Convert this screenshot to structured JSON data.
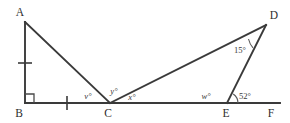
{
  "figure": {
    "type": "geometry-diagram",
    "background_color": "#ffffff",
    "line_color": "#3a3a3a",
    "vertices": [
      {
        "id": "A",
        "label": "A",
        "x": 25,
        "y": 22,
        "label_x": 20,
        "label_y": 16
      },
      {
        "id": "B",
        "label": "B",
        "x": 25,
        "y": 103,
        "label_x": 19,
        "label_y": 117
      },
      {
        "id": "C",
        "label": "C",
        "x": 110,
        "y": 103,
        "label_x": 105,
        "label_y": 117
      },
      {
        "id": "D",
        "label": "D",
        "x": 266,
        "y": 25,
        "label_x": 272,
        "label_y": 19
      },
      {
        "id": "E",
        "label": "E",
        "x": 227,
        "y": 103,
        "label_x": 222,
        "label_y": 117
      },
      {
        "id": "F",
        "label": "F",
        "x": 272,
        "y": 103,
        "label_x": 268,
        "label_y": 117
      }
    ],
    "segments": [
      {
        "name": "segment-AB",
        "from": "A",
        "to": "B"
      },
      {
        "name": "segment-AC",
        "from": "A",
        "to": "C"
      },
      {
        "name": "segment-BF",
        "from": "B",
        "to": "F"
      },
      {
        "name": "segment-CD",
        "from": "C",
        "to": "D"
      },
      {
        "name": "segment-DE",
        "from": "D",
        "to": "E"
      }
    ],
    "tick_marks": [
      {
        "name": "tick-mark-AB",
        "on_segment": "AB",
        "x": 25,
        "y": 63,
        "orientation": "horizontal"
      },
      {
        "name": "tick-mark-BC",
        "on_segment": "BC",
        "x": 67,
        "y": 103,
        "orientation": "vertical"
      }
    ],
    "right_angle": {
      "name": "right-angle-marker-B",
      "at_vertex": "B",
      "size": 9
    },
    "angle_labels": [
      {
        "name": "angle-label-v",
        "text": "v°",
        "x": 88,
        "y": 99,
        "style": "italic",
        "at_vertex": "C"
      },
      {
        "name": "angle-label-y",
        "text": "y°",
        "x": 113,
        "y": 94,
        "style": "italic",
        "at_vertex": "C"
      },
      {
        "name": "angle-label-x",
        "text": "x°",
        "x": 131,
        "y": 100,
        "style": "italic",
        "at_vertex": "C"
      },
      {
        "name": "angle-label-w",
        "text": "w°",
        "x": 203,
        "y": 99,
        "style": "italic",
        "at_vertex": "E"
      },
      {
        "name": "angle-label-52",
        "text": "52°",
        "x": 234,
        "y": 99,
        "style": "normal",
        "at_vertex": "E"
      },
      {
        "name": "angle-label-15",
        "text": "15°",
        "x": 236,
        "y": 53,
        "style": "normal",
        "at_vertex": "D"
      }
    ],
    "angle_arcs": [
      {
        "name": "angle-arc-52",
        "at_vertex": "E",
        "d": "M 238 103 A 11 11 0 0 0 233.5 94.2"
      },
      {
        "name": "angle-arc-15",
        "at_vertex": "D",
        "d": "M 249.5 39.5 A 21 21 0 0 0 253.5 47.5"
      }
    ],
    "known_values": {
      "angle_D": "15°",
      "angle_DEF": "52°",
      "unknowns": [
        "v",
        "y",
        "x",
        "w"
      ]
    }
  }
}
